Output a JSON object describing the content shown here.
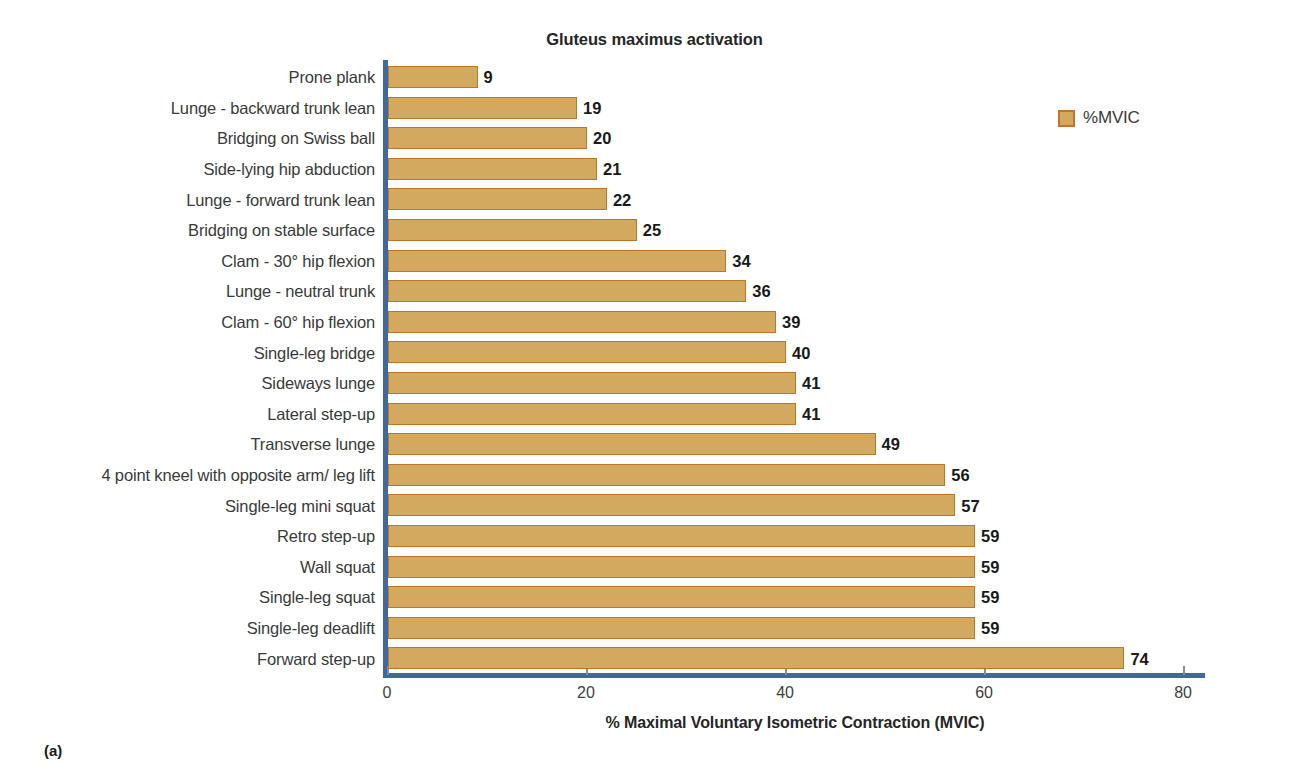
{
  "figure": {
    "panel_caption": "(a)"
  },
  "chart_data": {
    "type": "bar",
    "orientation": "horizontal",
    "title": "Gluteus maximus activation",
    "xlabel": "% Maximal Voluntary Isometric Contraction (MVIC)",
    "ylabel": "",
    "xlim": [
      0,
      82
    ],
    "xticks": [
      0,
      20,
      40,
      60,
      80
    ],
    "xtick_labels": [
      "0",
      "20",
      "40",
      "60",
      "80"
    ],
    "grid": false,
    "legend": {
      "position": "right",
      "entries": [
        {
          "label": "%MVIC",
          "color": "#d2a95f",
          "border_color": "#c0762a"
        }
      ]
    },
    "bar_fill_color": "#d2a95f",
    "bar_border_color": "#c0762a",
    "axis_color": "#41689c",
    "categories": [
      "Prone plank",
      "Lunge - backward trunk lean",
      "Bridging on Swiss ball",
      "Side-lying hip abduction",
      "Lunge - forward trunk lean",
      "Bridging on stable surface",
      "Clam - 30° hip flexion",
      "Lunge - neutral trunk",
      "Clam - 60° hip flexion",
      "Single-leg bridge",
      "Sideways lunge",
      "Lateral step-up",
      "Transverse lunge",
      "4 point kneel with opposite arm/ leg lift",
      "Single-leg mini squat",
      "Retro step-up",
      "Wall squat",
      "Single-leg squat",
      "Single-leg deadlift",
      "Forward step-up"
    ],
    "values": [
      9,
      19,
      20,
      21,
      22,
      25,
      34,
      36,
      39,
      40,
      41,
      41,
      49,
      56,
      57,
      59,
      59,
      59,
      59,
      74
    ],
    "value_labels": [
      "9",
      "19",
      "20",
      "21",
      "22",
      "25",
      "34",
      "36",
      "39",
      "40",
      "41",
      "41",
      "49",
      "56",
      "57",
      "59",
      "59",
      "59",
      "59",
      "74"
    ],
    "series": [
      {
        "name": "%MVIC",
        "values": [
          9,
          19,
          20,
          21,
          22,
          25,
          34,
          36,
          39,
          40,
          41,
          41,
          49,
          56,
          57,
          59,
          59,
          59,
          59,
          74
        ]
      }
    ]
  }
}
